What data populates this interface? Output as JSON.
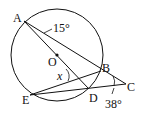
{
  "diagram": {
    "type": "geometry-circle",
    "circle": {
      "center": "O"
    },
    "points": [
      {
        "name": "A",
        "label": "A"
      },
      {
        "name": "B",
        "label": "B"
      },
      {
        "name": "C",
        "label": "C"
      },
      {
        "name": "D",
        "label": "D"
      },
      {
        "name": "E",
        "label": "E"
      },
      {
        "name": "O",
        "label": "O"
      }
    ],
    "segments": [
      "AC",
      "AD",
      "EB",
      "EC"
    ],
    "angles": {
      "angle_A": "15°",
      "angle_C": "38°",
      "angle_x": "x"
    },
    "colors": {
      "stroke": "#111111",
      "background": "#ffffff"
    }
  }
}
